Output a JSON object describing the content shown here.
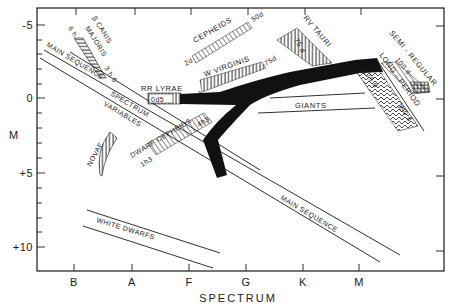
{
  "diagram": {
    "x_axis": {
      "label": "SPECTRUM",
      "ticks": [
        "B",
        "A",
        "F",
        "G",
        "K",
        "M"
      ]
    },
    "y_axis": {
      "label": "M",
      "ticks": [
        "-5",
        "0",
        "+5",
        "+10"
      ]
    },
    "regions": {
      "main_sequence_upper": "MAIN SEQUENCE",
      "main_sequence_lower": "MAIN SEQUENCE",
      "spectrum_variables_1": "SPECTRUM",
      "spectrum_variables_2": "VARIABLES",
      "white_dwarfs": "WHITE   DWARFS",
      "giants": "GIANTS",
      "novae": "NOVAE"
    },
    "variables": {
      "beta_canis": {
        "label": "β CANIS",
        "label2": "MAJORIS",
        "p_short": "6 h",
        "p_long": "3 h 5"
      },
      "cepheids": {
        "label": "CEPHEIDS",
        "p_short": "2d",
        "p_long": "50d"
      },
      "w_virginis": {
        "label": "W VIRGINIS",
        "p_short": "2d",
        "p_long": "75d"
      },
      "rr_lyrae": {
        "label": "RR LYRAE",
        "period": "0d5"
      },
      "dwarf_cepheids": {
        "label": "DWARF CEPHEIDS",
        "p_short": "1h3",
        "p_long": "4h3"
      },
      "rv_tauri": {
        "label": "RV TAURI",
        "period": "75 d"
      },
      "semi_regular": {
        "label": "SEMI - REGULAR",
        "period": "100 d"
      },
      "long_period": {
        "label": "LONG - PERIOD",
        "p_short": "175 d",
        "p_long": "350 d"
      }
    }
  }
}
